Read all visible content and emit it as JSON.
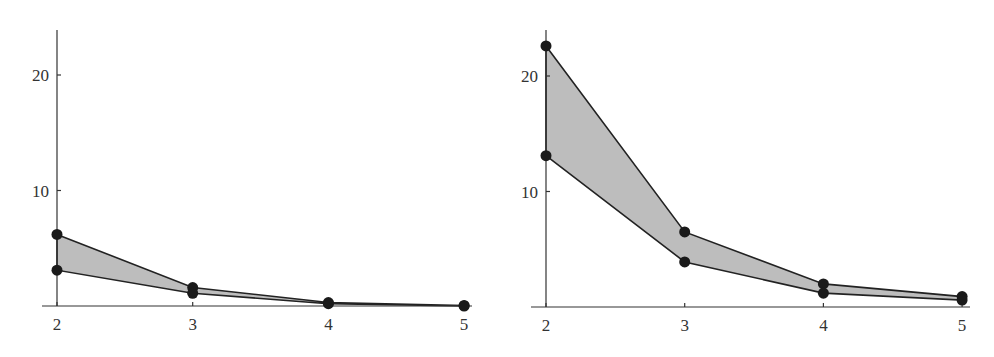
{
  "chart_data": [
    {
      "type": "area",
      "title": "",
      "xlabel": "",
      "ylabel": "",
      "x": [
        2,
        3,
        4,
        5
      ],
      "xticks": [
        "2",
        "3",
        "4",
        "5"
      ],
      "yticks": [
        "10",
        "20"
      ],
      "ylim": [
        0,
        24
      ],
      "grid": false,
      "series": [
        {
          "name": "upper",
          "values": [
            6.2,
            1.6,
            0.3,
            0.05
          ]
        },
        {
          "name": "lower",
          "values": [
            3.1,
            1.1,
            0.2,
            0.0
          ]
        }
      ],
      "fill_between": true,
      "fill_color": "#bdbdbd"
    },
    {
      "type": "area",
      "title": "",
      "xlabel": "",
      "ylabel": "",
      "x": [
        2,
        3,
        4,
        5
      ],
      "xticks": [
        "2",
        "3",
        "4",
        "5"
      ],
      "yticks": [
        "10",
        "20"
      ],
      "ylim": [
        0,
        24
      ],
      "grid": false,
      "series": [
        {
          "name": "upper",
          "values": [
            22.6,
            6.5,
            2.0,
            0.9
          ]
        },
        {
          "name": "lower",
          "values": [
            13.1,
            3.9,
            1.2,
            0.6
          ]
        }
      ],
      "fill_between": true,
      "fill_color": "#bdbdbd"
    }
  ],
  "panels": [
    {
      "origin_x": 57,
      "x_step": 135.7,
      "baseline_y": 306,
      "unit_px": 11.55,
      "axis_top": 30,
      "axis_right": 472
    },
    {
      "origin_x": 546,
      "x_step": 138.7,
      "baseline_y": 307,
      "unit_px": 11.55,
      "axis_top": 30,
      "axis_right": 970
    }
  ]
}
